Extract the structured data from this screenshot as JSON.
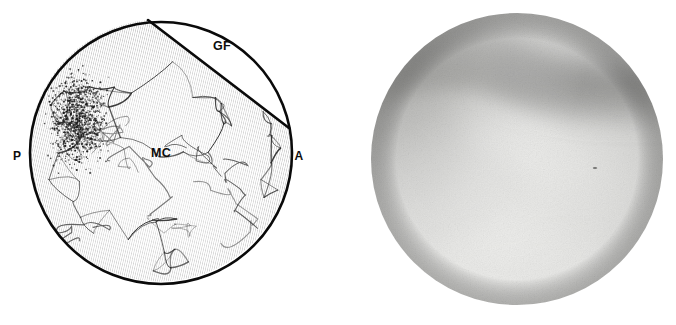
{
  "figure": {
    "panels": [
      {
        "id": "schematic",
        "kind": "line-drawing",
        "caption": "Schematic line drawing of the arthroscopic field of view"
      },
      {
        "id": "photograph",
        "kind": "grayscale-photograph",
        "caption": "Corresponding arthroscopic photograph"
      }
    ]
  },
  "schematic": {
    "field_of_view": {
      "shape": "circle",
      "center_x": 161,
      "center_y": 153,
      "radius": 131,
      "outline_color": "#0a0a0a",
      "outline_width": 2.6,
      "fill_color": "#ffffff"
    },
    "regions": [
      {
        "name": "glenoid-fossa",
        "label": "GF",
        "label_x": 222,
        "label_y": 50,
        "description": "blank lens-shaped segment at upper right bounded by a straight chord",
        "fill_color": "#ffffff",
        "texture": "none"
      },
      {
        "name": "mandibular-condyle",
        "label": "MC",
        "label_x": 161,
        "label_y": 157,
        "description": "main body filled with fine hatching and an irregular vascular network",
        "fill_color": "#ffffff",
        "texture": "diagonal-hatching-and-vessel-network"
      }
    ],
    "chord": {
      "name": "fossa-condyle-boundary",
      "x1": 148,
      "y1": 20,
      "x2": 289,
      "y2": 128,
      "color": "#0a0a0a",
      "width": 2.6
    },
    "orientation_labels": [
      {
        "label": "P",
        "meaning": "posterior",
        "x": 17,
        "y": 160
      },
      {
        "label": "A",
        "meaning": "anterior",
        "x": 299,
        "y": 160
      }
    ],
    "internal_labels": [
      {
        "label": "GF",
        "meaning": "glenoid fossa",
        "x": 222,
        "y": 50
      },
      {
        "label": "MC",
        "meaning": "mandibular condyle",
        "x": 161,
        "y": 157
      }
    ],
    "stipple_region": {
      "name": "synovial-hyperemia-stipple",
      "description": "dense dotted cluster in the posterosuperior region",
      "center_x": 78,
      "center_y": 120,
      "radius_x": 36,
      "radius_y": 58,
      "dot_color": "#1a1a1a",
      "dot_count": 1400
    },
    "hatching": {
      "color": "#4a4a4a",
      "line_width": 0.55,
      "angle_degrees": 13,
      "spacing": 2.1
    },
    "vessel_network": {
      "color": "#2b2b2b",
      "line_width": 1.0,
      "node_count": 46
    }
  },
  "photograph": {
    "field_of_view": {
      "shape": "circle",
      "center_x": 177,
      "center_y": 159,
      "radius": 146
    },
    "tones": {
      "background": "#ffffff",
      "highlight": "#f2f2f0",
      "mid": "#cfcfcd",
      "shadow": "#a8a8a6",
      "deep_shadow": "#8e8e8c",
      "corner_shadow": "#9a9a98"
    },
    "features": [
      {
        "name": "diagonal-shadow-band",
        "description": "soft dark band running from upper left to right across the upper third"
      },
      {
        "name": "upper-left-vignette",
        "description": "darker gradient in the upper left quadrant"
      },
      {
        "name": "bright-central-field",
        "description": "brightly illuminated lower-central region"
      },
      {
        "name": "debris-speck",
        "description": "small dark speck right of center",
        "x": 255,
        "y": 168
      }
    ],
    "grain": {
      "enabled": true,
      "intensity": 0.5
    }
  }
}
